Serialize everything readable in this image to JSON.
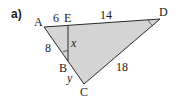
{
  "part_label": "a)",
  "colors": {
    "fill": "#d4d4d4",
    "stroke": "#2a2a2a"
  },
  "points": {
    "A": {
      "label": "A",
      "x": 44,
      "y": 27
    },
    "E": {
      "label": "E",
      "x": 68,
      "y": 25
    },
    "D": {
      "label": "D",
      "x": 160,
      "y": 19
    },
    "B": {
      "label": "B",
      "x": 68,
      "y": 61
    },
    "C": {
      "label": "C",
      "x": 84,
      "y": 84
    }
  },
  "lengths": {
    "AE": "6",
    "ED": "14",
    "AB": "8",
    "EB": "x",
    "BC": "y",
    "DC": "18"
  }
}
